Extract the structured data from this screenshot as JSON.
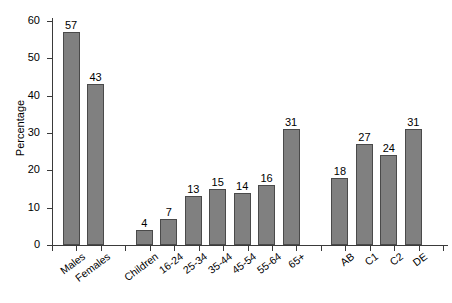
{
  "chart_data": {
    "type": "bar",
    "title": "",
    "xlabel": "",
    "ylabel": "Percentage",
    "ylim": [
      0,
      60
    ],
    "yticks": [
      0,
      10,
      20,
      30,
      40,
      50,
      60
    ],
    "grid": false,
    "legend": null,
    "categories": [
      "Males",
      "Females",
      "Children",
      "16-24",
      "25-34",
      "35-44",
      "45-54",
      "55-64",
      "65+",
      "AB",
      "C1",
      "C2",
      "DE"
    ],
    "values": [
      57,
      43,
      4,
      7,
      13,
      15,
      14,
      16,
      31,
      18,
      27,
      24,
      31
    ],
    "bar_color": "#808080",
    "bar_edge_color": "#4a4a4a",
    "axis_color": "#3a3a3a",
    "groups": [
      {
        "name": "gender",
        "categories": [
          "Males",
          "Females"
        ],
        "values": [
          57,
          43
        ]
      },
      {
        "name": "age",
        "categories": [
          "Children",
          "16-24",
          "25-34",
          "35-44",
          "45-54",
          "55-64",
          "65+"
        ],
        "values": [
          4,
          7,
          13,
          15,
          14,
          16,
          31
        ]
      },
      {
        "name": "social-grade",
        "categories": [
          "AB",
          "C1",
          "C2",
          "DE"
        ],
        "values": [
          18,
          27,
          24,
          31
        ]
      }
    ]
  }
}
